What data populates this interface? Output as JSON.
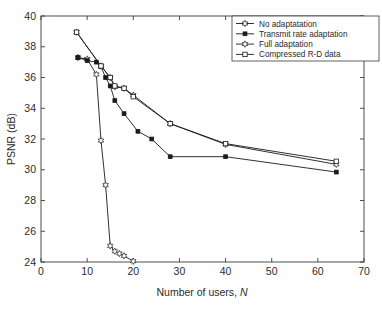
{
  "chart_data": {
    "type": "line",
    "title": "",
    "xlabel": "Number of users, N",
    "ylabel": "PSNR (dB)",
    "xlim": [
      0,
      70
    ],
    "ylim": [
      24,
      40
    ],
    "xticks": [
      0,
      10,
      20,
      30,
      40,
      50,
      60,
      70
    ],
    "yticks": [
      24,
      26,
      28,
      30,
      32,
      34,
      36,
      38,
      40
    ],
    "xtick_labels": [
      "0",
      "10",
      "20",
      "30",
      "40",
      "50",
      "60",
      "70"
    ],
    "ytick_labels": [
      "24",
      "26",
      "28",
      "30",
      "32",
      "34",
      "36",
      "38",
      "40"
    ],
    "grid": false,
    "legend_position": "top-right",
    "series": [
      {
        "name": "No adaptatation",
        "marker": "hexagram",
        "color": "#1a1a1a",
        "points": [
          {
            "x": 8,
            "y": 37.3
          },
          {
            "x": 10,
            "y": 37.2
          },
          {
            "x": 12,
            "y": 36.2
          },
          {
            "x": 13,
            "y": 31.9
          },
          {
            "x": 14,
            "y": 29.0
          },
          {
            "x": 15,
            "y": 25.05
          },
          {
            "x": 16,
            "y": 24.7
          },
          {
            "x": 17,
            "y": 24.55
          },
          {
            "x": 18,
            "y": 24.4
          },
          {
            "x": 20,
            "y": 24.05
          }
        ]
      },
      {
        "name": "Transmit rate adaptation",
        "marker": "filled-square",
        "color": "#1a1a1a",
        "points": [
          {
            "x": 8,
            "y": 37.3
          },
          {
            "x": 10,
            "y": 37.1
          },
          {
            "x": 12,
            "y": 37.0
          },
          {
            "x": 13,
            "y": 36.7
          },
          {
            "x": 14,
            "y": 36.0
          },
          {
            "x": 15,
            "y": 35.45
          },
          {
            "x": 16,
            "y": 34.5
          },
          {
            "x": 18,
            "y": 33.65
          },
          {
            "x": 21,
            "y": 32.5
          },
          {
            "x": 24,
            "y": 32.0
          },
          {
            "x": 28,
            "y": 30.85
          },
          {
            "x": 40,
            "y": 30.85
          },
          {
            "x": 64,
            "y": 29.85
          }
        ]
      },
      {
        "name": "Full adaptation",
        "marker": "hexagram-open",
        "color": "#1a1a1a",
        "points": [
          {
            "x": 7.7,
            "y": 38.95
          },
          {
            "x": 13,
            "y": 36.75
          },
          {
            "x": 15,
            "y": 36.0
          },
          {
            "x": 16,
            "y": 35.4
          },
          {
            "x": 18,
            "y": 35.3
          },
          {
            "x": 20,
            "y": 34.85
          },
          {
            "x": 28,
            "y": 33.0
          },
          {
            "x": 40,
            "y": 31.65
          },
          {
            "x": 64,
            "y": 30.35
          }
        ]
      },
      {
        "name": "Compressed R-D data",
        "marker": "open-square",
        "color": "#1a1a1a",
        "points": [
          {
            "x": 7.7,
            "y": 38.95
          },
          {
            "x": 13,
            "y": 36.75
          },
          {
            "x": 15,
            "y": 36.0
          },
          {
            "x": 16,
            "y": 35.45
          },
          {
            "x": 18,
            "y": 35.3
          },
          {
            "x": 20,
            "y": 34.75
          },
          {
            "x": 28,
            "y": 33.0
          },
          {
            "x": 40,
            "y": 31.7
          },
          {
            "x": 64,
            "y": 30.55
          }
        ]
      }
    ]
  },
  "legend": {
    "entries": [
      {
        "label": "No adaptatation"
      },
      {
        "label": "Transmit rate adaptation"
      },
      {
        "label": "Full adaptation"
      },
      {
        "label": "Compressed R-D data"
      }
    ]
  },
  "axes": {
    "xlabel_main": "Number of users, ",
    "xlabel_italic": "N",
    "ylabel": "PSNR (dB)"
  }
}
